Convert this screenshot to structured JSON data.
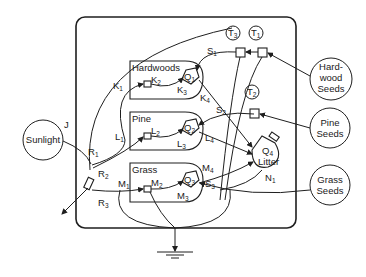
{
  "diagram": {
    "type": "compartment-flow-model",
    "sources": {
      "sunlight": "Sunlight",
      "hardwood_seeds": [
        "Hard-",
        "wood",
        "Seeds"
      ],
      "pine_seeds": [
        "Pine",
        "Seeds"
      ],
      "grass_seeds": [
        "Grass",
        "Seeds"
      ]
    },
    "compartments": {
      "hardwoods": {
        "label": "Hardwoods",
        "q": "Q",
        "q_sub": "1"
      },
      "pine": {
        "label": "Pine",
        "q": "Q",
        "q_sub": "2"
      },
      "grass": {
        "label": "Grass",
        "q": "Q",
        "q_sub": "3"
      },
      "litter": {
        "label": "Litter",
        "q": "Q",
        "q_sub": "4"
      }
    },
    "tanks": [
      {
        "id": "T1",
        "letter": "T",
        "sub": "1"
      },
      {
        "id": "T2",
        "letter": "T",
        "sub": "2"
      },
      {
        "id": "T3",
        "letter": "T",
        "sub": "3"
      }
    ],
    "flow_labels": [
      {
        "id": "J",
        "letter": "J",
        "sub": ""
      },
      {
        "id": "R1",
        "letter": "R",
        "sub": "1"
      },
      {
        "id": "R2",
        "letter": "R",
        "sub": "2"
      },
      {
        "id": "R3",
        "letter": "R",
        "sub": "3"
      },
      {
        "id": "K1",
        "letter": "K",
        "sub": "1"
      },
      {
        "id": "K2",
        "letter": "K",
        "sub": "2"
      },
      {
        "id": "K3",
        "letter": "K",
        "sub": "3"
      },
      {
        "id": "K4",
        "letter": "K",
        "sub": "4"
      },
      {
        "id": "L1",
        "letter": "L",
        "sub": "1"
      },
      {
        "id": "L2",
        "letter": "L",
        "sub": "2"
      },
      {
        "id": "L3",
        "letter": "L",
        "sub": "3"
      },
      {
        "id": "L4",
        "letter": "L",
        "sub": "4"
      },
      {
        "id": "M1",
        "letter": "M",
        "sub": "1"
      },
      {
        "id": "M2",
        "letter": "M",
        "sub": "2"
      },
      {
        "id": "M3",
        "letter": "M",
        "sub": "3"
      },
      {
        "id": "M4",
        "letter": "M",
        "sub": "4"
      },
      {
        "id": "S1",
        "letter": "S",
        "sub": "1"
      },
      {
        "id": "S2",
        "letter": "S",
        "sub": "2"
      },
      {
        "id": "S3",
        "letter": "S",
        "sub": "3"
      },
      {
        "id": "N1",
        "letter": "N",
        "sub": "1"
      }
    ],
    "colors": {
      "stroke": "#1f1f1f",
      "background": "#ffffff"
    }
  }
}
